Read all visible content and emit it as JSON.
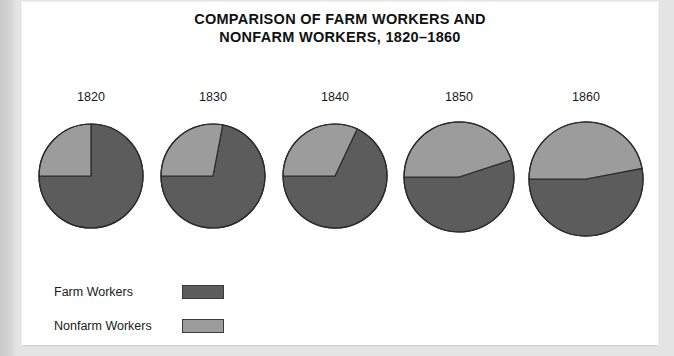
{
  "title": {
    "line1": "COMPARISON OF FARM WORKERS AND",
    "line2": "NONFARM WORKERS, 1820–1860"
  },
  "legend": {
    "items": [
      {
        "label": "Farm Workers",
        "color": "#5c5c5c"
      },
      {
        "label": "Nonfarm Workers",
        "color": "#9c9c9c"
      }
    ]
  },
  "colors": {
    "farm": "#5c5c5c",
    "nonfarm": "#9c9c9c",
    "outline": "#2b2b2b",
    "page": "#ffffff",
    "backdrop": "#e4e4e4"
  },
  "chart_data": {
    "type": "pie",
    "title": "COMPARISON OF FARM WORKERS AND NONFARM WORKERS, 1820–1860",
    "xlabel": "",
    "ylabel": "",
    "legend_position": "bottom-left",
    "grid": false,
    "panels": [
      {
        "label": "1820",
        "slices": [
          {
            "name": "Farm Workers",
            "value": 75,
            "color": "#5c5c5c"
          },
          {
            "name": "Nonfarm Workers",
            "value": 25,
            "color": "#9c9c9c"
          }
        ]
      },
      {
        "label": "1830",
        "slices": [
          {
            "name": "Farm Workers",
            "value": 72,
            "color": "#5c5c5c"
          },
          {
            "name": "Nonfarm Workers",
            "value": 28,
            "color": "#9c9c9c"
          }
        ]
      },
      {
        "label": "1840",
        "slices": [
          {
            "name": "Farm Workers",
            "value": 68,
            "color": "#5c5c5c"
          },
          {
            "name": "Nonfarm Workers",
            "value": 32,
            "color": "#9c9c9c"
          }
        ]
      },
      {
        "label": "1850",
        "slices": [
          {
            "name": "Farm Workers",
            "value": 55,
            "color": "#5c5c5c"
          },
          {
            "name": "Nonfarm Workers",
            "value": 45,
            "color": "#9c9c9c"
          }
        ]
      },
      {
        "label": "1860",
        "slices": [
          {
            "name": "Farm Workers",
            "value": 53,
            "color": "#5c5c5c"
          },
          {
            "name": "Nonfarm Workers",
            "value": 47,
            "color": "#9c9c9c"
          }
        ]
      }
    ],
    "series": [
      {
        "name": "Farm Workers",
        "values": [
          75,
          72,
          68,
          55,
          53
        ]
      },
      {
        "name": "Nonfarm Workers",
        "values": [
          25,
          28,
          32,
          45,
          47
        ]
      }
    ],
    "categories": [
      "1820",
      "1830",
      "1840",
      "1850",
      "1860"
    ]
  },
  "layout": {
    "pie_centers_x": [
      69,
      191,
      313,
      437,
      564
    ],
    "pie_radius": [
      52,
      52,
      52,
      55,
      57
    ],
    "pie_center_y": [
      62,
      62,
      62,
      63,
      65
    ]
  }
}
